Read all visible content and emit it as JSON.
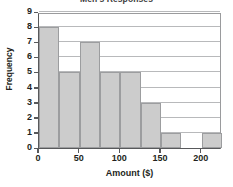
{
  "chart_data": {
    "type": "bar",
    "title": "Men's Responses",
    "xlabel": "Amount ($)",
    "ylabel": "Frequency",
    "xlim": [
      0,
      225
    ],
    "ylim": [
      0,
      9
    ],
    "grid": true,
    "legend": "none",
    "bin_width": 25,
    "x_ticks": [
      0,
      50,
      100,
      150,
      200
    ],
    "x_tick_labels": [
      "0",
      "50",
      "100",
      "150",
      "200"
    ],
    "y_ticks": [
      0,
      1,
      2,
      3,
      4,
      5,
      6,
      7,
      8,
      9
    ],
    "y_tick_labels": [
      "0",
      "1",
      "2",
      "3",
      "4",
      "5",
      "6",
      "7",
      "8",
      "9"
    ],
    "bar_fill_color": "#cccccc",
    "bar_edge_color": "#9c9d9f",
    "categories": [
      "0-25",
      "25-50",
      "50-75",
      "75-100",
      "100-125",
      "125-150",
      "150-175",
      "175-200",
      "200-225"
    ],
    "bin_starts": [
      0,
      25,
      50,
      75,
      100,
      125,
      150,
      175,
      200
    ],
    "bin_ends": [
      25,
      50,
      75,
      100,
      125,
      150,
      175,
      200,
      225
    ],
    "values": [
      8,
      5,
      7,
      5,
      5,
      3,
      1,
      0,
      1
    ]
  }
}
